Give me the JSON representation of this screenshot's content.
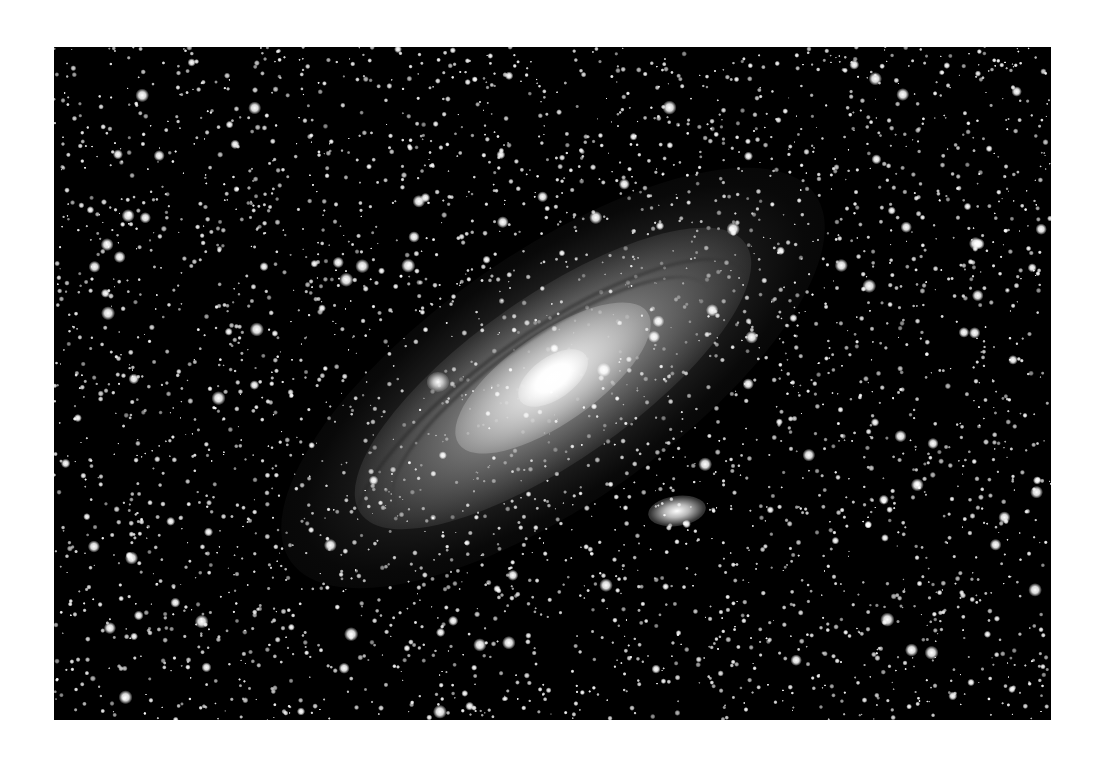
{
  "page": {
    "background": "#ffffff"
  },
  "photo": {
    "subject": "Andromeda Galaxy (M31) with satellite galaxies M32 and M110",
    "style": "black-and-white astrophotograph",
    "frame": {
      "x": 54,
      "y": 47,
      "width": 997,
      "height": 673,
      "background": "#000000"
    },
    "galaxy": {
      "center": {
        "x": 499,
        "y": 331
      },
      "rotation_deg": -35,
      "halo": {
        "width": 640,
        "height": 250
      },
      "disk": {
        "width": 470,
        "height": 165
      },
      "inner": {
        "width": 230,
        "height": 90
      },
      "core": {
        "width": 80,
        "height": 42
      },
      "dust_lanes": [
        {
          "dx": 20,
          "dy": 38,
          "width": 380,
          "height": 120
        },
        {
          "dx": 35,
          "dy": 62,
          "width": 470,
          "height": 150
        }
      ]
    },
    "satellites": [
      {
        "name": "M32",
        "x": 384,
        "y": 335,
        "width": 22,
        "height": 20,
        "rotation_deg": 0
      },
      {
        "name": "M110",
        "x": 623,
        "y": 464,
        "width": 58,
        "height": 30,
        "rotation_deg": -8
      }
    ],
    "starfield": {
      "seed": 31,
      "count": 2600,
      "bright_count": 140,
      "color": "#ffffff"
    }
  }
}
